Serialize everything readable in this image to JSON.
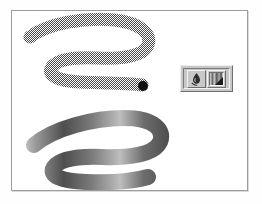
{
  "figure": {
    "background_color": "#fefefe",
    "canvas": {
      "name": "drawing-canvas",
      "background_color": "#ffffff",
      "border_color": "#9b9b9b"
    }
  },
  "strokes": [
    {
      "id": "halftone-stroke",
      "label": "Halftone dithered brush stroke",
      "style": "halftone",
      "pattern": "checkerboard-dither",
      "ink_color": "#4a4a4a",
      "endpoint_dot_color": "#111111",
      "path": "M 28 36 C 46 22, 84 16, 112 19 C 140 22, 150 34, 146 44 C 142 55, 120 58, 96 57 C 72 56, 56 58, 50 66 C 44 74, 56 80, 78 81 C 104 82, 126 82, 140 84",
      "stroke_width": 13,
      "endpoint": {
        "x": 141,
        "y": 85,
        "r": 5
      }
    },
    {
      "id": "gradient-stroke",
      "label": "Gradient filled brush stroke",
      "style": "gradient",
      "gradient_stops": [
        {
          "offset": 0.0,
          "color": "#f2f2f2"
        },
        {
          "offset": 0.1,
          "color": "#9a9a9a"
        },
        {
          "offset": 0.22,
          "color": "#4e4e4e"
        },
        {
          "offset": 0.34,
          "color": "#7b7b7b"
        },
        {
          "offset": 0.46,
          "color": "#bdbdbd"
        },
        {
          "offset": 0.56,
          "color": "#6d6d6d"
        },
        {
          "offset": 0.68,
          "color": "#4a4a4a"
        },
        {
          "offset": 0.8,
          "color": "#8e8e8e"
        },
        {
          "offset": 0.9,
          "color": "#5a5a5a"
        },
        {
          "offset": 1.0,
          "color": "#3d3d3d"
        }
      ],
      "path": "M 32 144 C 52 127, 92 117, 122 117 C 152 117, 163 129, 158 141 C 152 154, 126 157, 100 156 C 76 155, 58 158, 52 166 C 46 175, 60 180, 84 181 C 110 182, 132 180, 146 176",
      "stroke_width": 16
    }
  ],
  "tool_palette": {
    "name": "floating-tool-palette",
    "buttons": [
      {
        "id": "blend-tool",
        "icon": "blend-smudge-icon",
        "label": "Blend tool",
        "state": "raised"
      },
      {
        "id": "gradient-swatch",
        "icon": "gradient-swatch-icon",
        "label": "Gradient swatch",
        "state": "raised",
        "has_dropdown": true,
        "swatch_stops": [
          {
            "offset": 0.0,
            "color": "#dcdcdc"
          },
          {
            "offset": 0.18,
            "color": "#6a6a6a"
          },
          {
            "offset": 0.34,
            "color": "#c4c4c4"
          },
          {
            "offset": 0.52,
            "color": "#575757"
          },
          {
            "offset": 0.7,
            "color": "#b0b0b0"
          },
          {
            "offset": 0.86,
            "color": "#4c4c4c"
          },
          {
            "offset": 1.0,
            "color": "#e8e8e8"
          }
        ]
      }
    ]
  }
}
